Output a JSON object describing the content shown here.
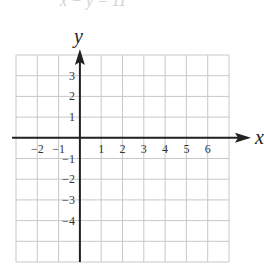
{
  "top_fragment": {
    "text": "x − y = 11"
  },
  "chart_data": {
    "type": "coordinate-grid",
    "title": "",
    "xlabel": "x",
    "ylabel": "y",
    "xlim": [
      -3,
      7
    ],
    "ylim": [
      -6,
      4
    ],
    "grid": true,
    "x_ticks": [
      "−2",
      "−1",
      "1",
      "2",
      "3",
      "4",
      "5",
      "6"
    ],
    "x_tick_values": [
      -2,
      -1,
      1,
      2,
      3,
      4,
      5,
      6
    ],
    "y_ticks": [
      "3",
      "2",
      "1",
      "−1",
      "−2",
      "−3",
      "−4"
    ],
    "y_tick_values": [
      3,
      2,
      1,
      -1,
      -2,
      -3,
      -4
    ],
    "series": []
  },
  "colors": {
    "grid": "#c8c8c8",
    "axis": "#222222",
    "text": "#333333"
  }
}
